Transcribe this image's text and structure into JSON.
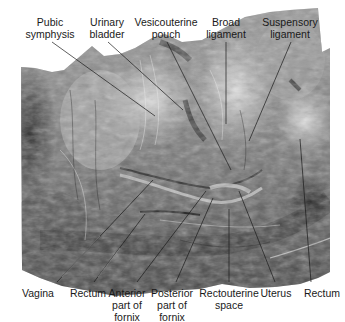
{
  "figure": {
    "top_labels": [
      {
        "id": "pubic-symphysis",
        "lines": [
          "Pubic",
          "symphysis"
        ],
        "x": 50,
        "target": [
          155,
          116
        ]
      },
      {
        "id": "urinary-bladder",
        "lines": [
          "Urinary",
          "bladder"
        ],
        "x": 106,
        "target": [
          183,
          110
        ]
      },
      {
        "id": "vesicouterine-pouch",
        "lines": [
          "Vesicouterine",
          "pouch"
        ],
        "x": 166,
        "target": [
          231,
          170
        ]
      },
      {
        "id": "broad-ligament",
        "lines": [
          "Broad",
          "ligament"
        ],
        "x": 226,
        "target": [
          226,
          124
        ]
      },
      {
        "id": "suspensory-ligament",
        "lines": [
          "Suspensory",
          "ligament"
        ],
        "x": 290,
        "target": [
          249,
          141
        ]
      }
    ],
    "bottom_labels": [
      {
        "id": "vagina",
        "lines": [
          "Vagina"
        ],
        "x": 38,
        "target": [
          153,
          180
        ]
      },
      {
        "id": "rectum-left",
        "lines": [
          "Rectum"
        ],
        "x": 88,
        "target": [
          145,
          214
        ]
      },
      {
        "id": "anterior-fornix",
        "lines": [
          "Anterior",
          "part of",
          "fornix"
        ],
        "x": 128,
        "target": [
          206,
          191
        ]
      },
      {
        "id": "posterior-fornix",
        "lines": [
          "Posterior",
          "part of",
          "fornix"
        ],
        "x": 172,
        "target": [
          213,
          198
        ]
      },
      {
        "id": "rectouterine-space",
        "lines": [
          "Rectouterine",
          "space"
        ],
        "x": 229,
        "target": [
          229,
          209
        ]
      },
      {
        "id": "uterus",
        "lines": [
          "Uterus"
        ],
        "x": 276,
        "target": [
          239,
          191
        ]
      },
      {
        "id": "rectum-right",
        "lines": [
          "Rectum"
        ],
        "x": 322,
        "target": [
          300,
          139
        ]
      }
    ]
  },
  "labels": {
    "pubic_symphysis_1": "Pubic",
    "pubic_symphysis_2": "symphysis",
    "urinary_bladder_1": "Urinary",
    "urinary_bladder_2": "bladder",
    "vesicouterine_pouch_1": "Vesicouterine",
    "vesicouterine_pouch_2": "pouch",
    "broad_ligament_1": "Broad",
    "broad_ligament_2": "ligament",
    "suspensory_ligament_1": "Suspensory",
    "suspensory_ligament_2": "ligament",
    "vagina": "Vagina",
    "rectum_left": "Rectum",
    "anterior_fornix_1": "Anterior",
    "anterior_fornix_2": "part of",
    "anterior_fornix_3": "fornix",
    "posterior_fornix_1": "Posterior",
    "posterior_fornix_2": "part of",
    "posterior_fornix_3": "fornix",
    "rectouterine_space_1": "Rectouterine",
    "rectouterine_space_2": "space",
    "uterus": "Uterus",
    "rectum_right": "Rectum"
  },
  "colors": {
    "background": "#ffffff",
    "tissue_light": "#d8d8d8",
    "tissue_mid": "#8a8a8a",
    "tissue_dark": "#2a2a2a",
    "leader_line": "#1a1a1a",
    "text": "#1a1a1a"
  }
}
